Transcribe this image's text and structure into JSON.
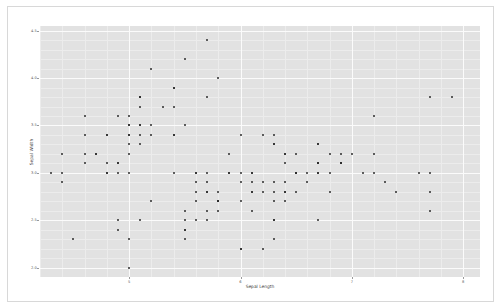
{
  "chart_data": {
    "type": "scatter",
    "title": "",
    "xlabel": "Sepal Length",
    "ylabel": "Sepal Width",
    "xlim": [
      4.2,
      8.15
    ],
    "ylim": [
      1.9,
      4.55
    ],
    "xticks": [
      5,
      6,
      7,
      8
    ],
    "xticklabels": [
      "5",
      "6",
      "7",
      "8"
    ],
    "yticks": [
      2.0,
      2.5,
      3.0,
      3.5,
      4.0,
      4.5
    ],
    "yticklabels": [
      "2.0",
      "2.5",
      "3.0",
      "3.5",
      "4.0",
      "4.5"
    ],
    "grid": true,
    "legend": false,
    "background": "#e2e2e2",
    "gridcolor": "#fbfbfb",
    "markercolor": "#2b2b2b",
    "markersize": 2,
    "n_points": 150,
    "points": [
      [
        5.1,
        3.5
      ],
      [
        4.9,
        3.0
      ],
      [
        4.7,
        3.2
      ],
      [
        4.6,
        3.1
      ],
      [
        5.0,
        3.6
      ],
      [
        5.4,
        3.9
      ],
      [
        4.6,
        3.4
      ],
      [
        5.0,
        3.4
      ],
      [
        4.4,
        2.9
      ],
      [
        4.9,
        3.1
      ],
      [
        5.4,
        3.7
      ],
      [
        4.8,
        3.4
      ],
      [
        4.8,
        3.0
      ],
      [
        4.3,
        3.0
      ],
      [
        5.8,
        4.0
      ],
      [
        5.7,
        4.4
      ],
      [
        5.4,
        3.9
      ],
      [
        5.1,
        3.5
      ],
      [
        5.7,
        3.8
      ],
      [
        5.1,
        3.8
      ],
      [
        5.4,
        3.4
      ],
      [
        5.1,
        3.7
      ],
      [
        4.6,
        3.6
      ],
      [
        5.1,
        3.3
      ],
      [
        4.8,
        3.4
      ],
      [
        5.0,
        3.0
      ],
      [
        5.0,
        3.4
      ],
      [
        5.2,
        3.5
      ],
      [
        5.2,
        3.4
      ],
      [
        4.7,
        3.2
      ],
      [
        4.8,
        3.1
      ],
      [
        5.4,
        3.4
      ],
      [
        5.2,
        4.1
      ],
      [
        5.5,
        4.2
      ],
      [
        4.9,
        3.1
      ],
      [
        5.0,
        3.2
      ],
      [
        5.5,
        3.5
      ],
      [
        4.9,
        3.6
      ],
      [
        4.4,
        3.0
      ],
      [
        5.1,
        3.4
      ],
      [
        5.0,
        3.5
      ],
      [
        4.5,
        2.3
      ],
      [
        4.4,
        3.2
      ],
      [
        5.0,
        3.5
      ],
      [
        5.1,
        3.8
      ],
      [
        4.8,
        3.0
      ],
      [
        5.1,
        3.8
      ],
      [
        4.6,
        3.2
      ],
      [
        5.3,
        3.7
      ],
      [
        5.0,
        3.3
      ],
      [
        7.0,
        3.2
      ],
      [
        6.4,
        3.2
      ],
      [
        6.9,
        3.1
      ],
      [
        5.5,
        2.3
      ],
      [
        6.5,
        2.8
      ],
      [
        5.7,
        2.8
      ],
      [
        6.3,
        3.3
      ],
      [
        4.9,
        2.4
      ],
      [
        6.6,
        2.9
      ],
      [
        5.2,
        2.7
      ],
      [
        5.0,
        2.0
      ],
      [
        5.9,
        3.0
      ],
      [
        6.0,
        2.2
      ],
      [
        6.1,
        2.9
      ],
      [
        5.6,
        2.9
      ],
      [
        6.7,
        3.1
      ],
      [
        5.6,
        3.0
      ],
      [
        5.8,
        2.7
      ],
      [
        6.2,
        2.2
      ],
      [
        5.6,
        2.5
      ],
      [
        5.9,
        3.2
      ],
      [
        6.1,
        2.8
      ],
      [
        6.3,
        2.5
      ],
      [
        6.1,
        2.8
      ],
      [
        6.4,
        2.9
      ],
      [
        6.6,
        3.0
      ],
      [
        6.8,
        2.8
      ],
      [
        6.7,
        3.0
      ],
      [
        6.0,
        2.9
      ],
      [
        5.7,
        2.6
      ],
      [
        5.5,
        2.4
      ],
      [
        5.5,
        2.4
      ],
      [
        5.8,
        2.7
      ],
      [
        6.0,
        2.7
      ],
      [
        5.4,
        3.0
      ],
      [
        6.0,
        3.4
      ],
      [
        6.7,
        3.1
      ],
      [
        6.3,
        2.3
      ],
      [
        5.6,
        3.0
      ],
      [
        5.5,
        2.5
      ],
      [
        5.5,
        2.6
      ],
      [
        6.1,
        3.0
      ],
      [
        5.8,
        2.6
      ],
      [
        5.0,
        2.3
      ],
      [
        5.6,
        2.7
      ],
      [
        5.7,
        3.0
      ],
      [
        5.7,
        2.9
      ],
      [
        6.2,
        2.9
      ],
      [
        5.1,
        2.5
      ],
      [
        5.7,
        2.8
      ],
      [
        6.3,
        3.3
      ],
      [
        5.8,
        2.7
      ],
      [
        7.1,
        3.0
      ],
      [
        6.3,
        2.9
      ],
      [
        6.5,
        3.0
      ],
      [
        7.6,
        3.0
      ],
      [
        4.9,
        2.5
      ],
      [
        7.3,
        2.9
      ],
      [
        6.7,
        2.5
      ],
      [
        7.2,
        3.6
      ],
      [
        6.5,
        3.2
      ],
      [
        6.4,
        2.7
      ],
      [
        6.8,
        3.0
      ],
      [
        5.7,
        2.5
      ],
      [
        5.8,
        2.8
      ],
      [
        6.4,
        3.2
      ],
      [
        6.5,
        3.0
      ],
      [
        7.7,
        3.8
      ],
      [
        7.7,
        2.6
      ],
      [
        6.0,
        2.2
      ],
      [
        6.9,
        3.2
      ],
      [
        5.6,
        2.8
      ],
      [
        7.7,
        2.8
      ],
      [
        6.3,
        2.7
      ],
      [
        6.7,
        3.3
      ],
      [
        7.2,
        3.2
      ],
      [
        6.2,
        2.8
      ],
      [
        6.1,
        3.0
      ],
      [
        6.4,
        2.8
      ],
      [
        7.2,
        3.0
      ],
      [
        7.4,
        2.8
      ],
      [
        7.9,
        3.8
      ],
      [
        6.4,
        2.8
      ],
      [
        6.3,
        2.8
      ],
      [
        6.1,
        2.6
      ],
      [
        7.7,
        3.0
      ],
      [
        6.3,
        3.4
      ],
      [
        6.4,
        3.1
      ],
      [
        6.0,
        3.0
      ],
      [
        6.9,
        3.1
      ],
      [
        6.7,
        3.1
      ],
      [
        6.9,
        3.1
      ],
      [
        5.8,
        2.7
      ],
      [
        6.8,
        3.2
      ],
      [
        6.7,
        3.3
      ],
      [
        6.7,
        3.0
      ],
      [
        6.3,
        2.5
      ],
      [
        6.5,
        3.0
      ],
      [
        6.2,
        3.4
      ],
      [
        5.9,
        3.0
      ]
    ]
  }
}
